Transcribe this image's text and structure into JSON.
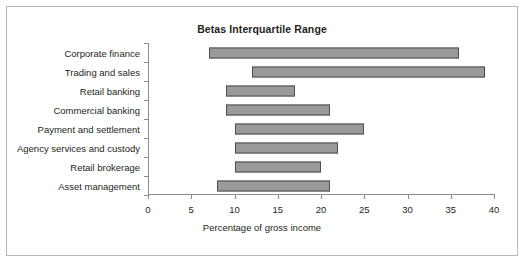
{
  "chart_data": {
    "type": "bar",
    "subtype": "floating-range-bar",
    "title": "Betas Interquartile Range",
    "xlabel": "Percentage of gross income",
    "ylabel": "",
    "xlim": [
      0,
      40
    ],
    "xticks": [
      0,
      5,
      10,
      15,
      20,
      25,
      30,
      35,
      40
    ],
    "xtick_labels": [
      "0",
      "5",
      "10",
      "15",
      "20",
      "25",
      "30",
      "35",
      "40"
    ],
    "grid": false,
    "legend": false,
    "categories": [
      "Corporate finance",
      "Trading and sales",
      "Retail banking",
      "Commercial banking",
      "Payment and settlement",
      "Agency services and custody",
      "Retail brokerage",
      "Asset management"
    ],
    "series": [
      {
        "name": "Interquartile range",
        "low": [
          7,
          12,
          9,
          9,
          10,
          10,
          10,
          8
        ],
        "high": [
          36,
          39,
          17,
          21,
          25,
          22,
          20,
          21
        ]
      }
    ],
    "bars": [
      {
        "category": "Corporate finance",
        "low": 7,
        "high": 36
      },
      {
        "category": "Trading and sales",
        "low": 12,
        "high": 39
      },
      {
        "category": "Retail banking",
        "low": 9,
        "high": 17
      },
      {
        "category": "Commercial banking",
        "low": 9,
        "high": 21
      },
      {
        "category": "Payment and settlement",
        "low": 10,
        "high": 25
      },
      {
        "category": "Agency services and custody",
        "low": 10,
        "high": 22
      },
      {
        "category": "Retail brokerage",
        "low": 10,
        "high": 20
      },
      {
        "category": "Asset management",
        "low": 8,
        "high": 21
      }
    ],
    "colors": {
      "bar_fill": "#9a9a9a",
      "bar_border": "#4d4d4d",
      "axis": "#8c8c8c",
      "text": "#231f20",
      "frame": "#b9b9b9",
      "background": "#ffffff"
    }
  }
}
